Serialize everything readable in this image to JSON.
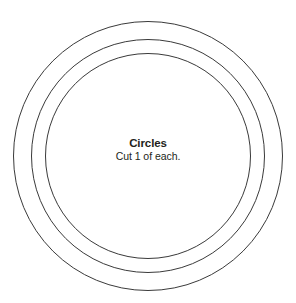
{
  "document": {
    "kind": "sewing-pattern-template",
    "background_color": "#ffffff",
    "width": 296,
    "height": 303
  },
  "label": {
    "title": "Circles",
    "subtitle": "Cut 1 of each.",
    "text_color": "#231f20"
  },
  "shapes": {
    "stroke_color": "#3a3a3a",
    "fill_color": "#ffffff",
    "center_x": 148,
    "center_y": 156,
    "circles": [
      {
        "name": "outer-circle",
        "radius": 134.5,
        "stroke_width": 1.0
      },
      {
        "name": "middle-circle",
        "radius": 116.5,
        "stroke_width": 1.0
      },
      {
        "name": "inner-circle",
        "radius": 102.5,
        "stroke_width": 1.0
      }
    ]
  }
}
